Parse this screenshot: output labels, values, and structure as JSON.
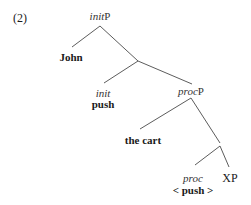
{
  "example": {
    "number": "(2)"
  },
  "tree": {
    "root": {
      "cat_italic": "init",
      "cat_suffix": "P"
    },
    "spec_init": {
      "word": "John"
    },
    "init_head": {
      "cat_italic": "init",
      "word": "push"
    },
    "procP": {
      "cat_italic": "proc",
      "cat_suffix": "P"
    },
    "spec_proc": {
      "word": "the cart"
    },
    "proc_head": {
      "cat_italic": "proc",
      "word": "< push >"
    },
    "complement": {
      "cat": "XP"
    }
  },
  "edges": [
    {
      "from": "initP",
      "to": "John"
    },
    {
      "from": "initP",
      "to": "init-bar"
    },
    {
      "from": "init-bar",
      "to": "init"
    },
    {
      "from": "init-bar",
      "to": "procP"
    },
    {
      "from": "procP",
      "to": "the cart"
    },
    {
      "from": "procP",
      "to": "proc-bar"
    },
    {
      "from": "proc-bar",
      "to": "proc"
    },
    {
      "from": "proc-bar",
      "to": "XP"
    }
  ],
  "colors": {
    "line": "#444444",
    "text": "#1a1a1a"
  }
}
